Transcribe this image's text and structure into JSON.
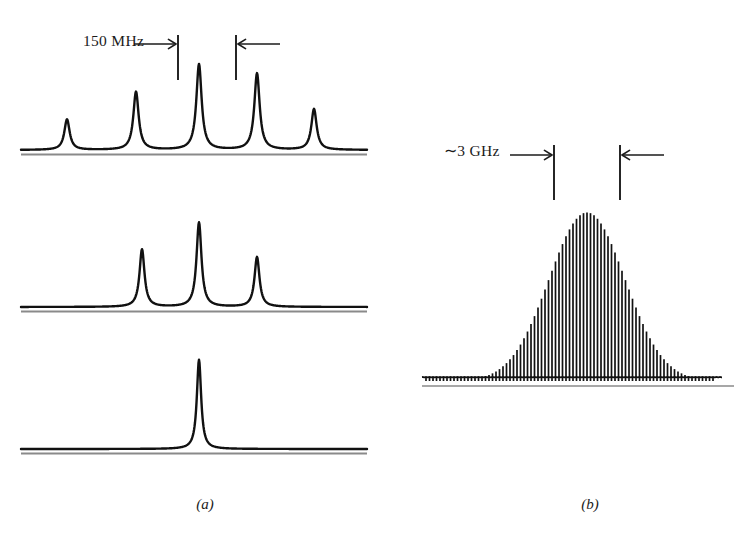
{
  "figure": {
    "panels": [
      {
        "id": "a",
        "caption": "(a)",
        "scale_label": "150 MHz",
        "scale_interval_hz": 150000000
      },
      {
        "id": "b",
        "caption": "(b)",
        "scale_label": "∼3 GHz",
        "scale_interval_hz": 3000000000
      }
    ]
  },
  "colors": {
    "trace": "#111111",
    "baseline_shadow": "#8a8a8a",
    "annotation": "#1b1b1b",
    "background": "#ffffff"
  },
  "chart_data": [
    {
      "type": "line",
      "id": "panel-a-trace-1",
      "title": "Multimode laser spectrum — five longitudinal modes",
      "xlabel": "",
      "ylabel": "Intensity",
      "grid": false,
      "legend": null,
      "xlim": [
        0,
        340
      ],
      "ylim": [
        0,
        100
      ],
      "baseline_y": 0,
      "peak_shape": "lorentzian",
      "peak_halfwidth": 3.2,
      "peaks": [
        {
          "x": 46,
          "height": 30
        },
        {
          "x": 115,
          "height": 57
        },
        {
          "x": 178,
          "height": 84
        },
        {
          "x": 236,
          "height": 75
        },
        {
          "x": 293,
          "height": 40
        }
      ]
    },
    {
      "type": "line",
      "id": "panel-a-trace-2",
      "title": "Intermediate spectrum — three longitudinal modes",
      "xlabel": "",
      "ylabel": "Intensity",
      "grid": false,
      "legend": null,
      "xlim": [
        0,
        340
      ],
      "ylim": [
        0,
        100
      ],
      "baseline_y": 0,
      "peak_shape": "lorentzian",
      "peak_halfwidth": 3.0,
      "peaks": [
        {
          "x": 121,
          "height": 60
        },
        {
          "x": 178,
          "height": 88
        },
        {
          "x": 236,
          "height": 52
        }
      ]
    },
    {
      "type": "line",
      "id": "panel-a-trace-3",
      "title": "Single-mode spectrum — one longitudinal mode",
      "xlabel": "",
      "ylabel": "Intensity",
      "grid": false,
      "legend": null,
      "xlim": [
        0,
        340
      ],
      "ylim": [
        0,
        100
      ],
      "baseline_y": 0,
      "peak_shape": "lorentzian",
      "peak_halfwidth": 2.6,
      "peaks": [
        {
          "x": 178,
          "height": 92
        }
      ]
    },
    {
      "type": "line",
      "id": "panel-b-comb",
      "title": "Mode-comb spectrum under Gaussian gain envelope",
      "xlabel": "",
      "ylabel": "Intensity",
      "grid": false,
      "legend": null,
      "xlim": [
        0,
        288
      ],
      "ylim": [
        0,
        100
      ],
      "baseline_y": 0,
      "envelope": "gaussian",
      "envelope_center": 165,
      "envelope_sigma": 38,
      "envelope_peak": 98,
      "comb_spacing": 3.5,
      "comb_count": 83,
      "comb_first_x": 4
    }
  ],
  "annotations": {
    "panel_a": {
      "tick_left_x": 178,
      "tick_right_x": 236,
      "tick_top_y": 35,
      "tick_bottom_y": 80,
      "arrow_in_left": true,
      "arrow_in_right": true
    },
    "panel_b": {
      "tick_left_x": 554,
      "tick_right_x": 620,
      "tick_top_y": 145,
      "tick_bottom_y": 200,
      "arrow_in_left": true,
      "arrow_in_right": true
    }
  }
}
